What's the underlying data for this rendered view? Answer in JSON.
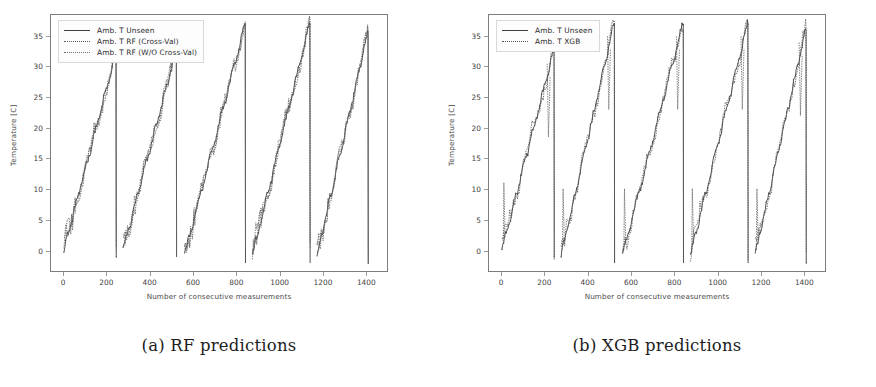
{
  "figure": {
    "background": "#ffffff",
    "panels": [
      {
        "id": "panel-a",
        "caption": "(a) RF predictions",
        "chart_data": {
          "type": "line",
          "title": "",
          "xlabel": "Number of consecutive measurements",
          "ylabel": "Temperature [C]",
          "xlim": [
            -60,
            1500
          ],
          "ylim": [
            -3.5,
            38.5
          ],
          "xticks": [
            0,
            200,
            400,
            600,
            800,
            1000,
            1200,
            1400
          ],
          "yticks": [
            0,
            5,
            10,
            15,
            20,
            25,
            30,
            35
          ],
          "grid": false,
          "legend_position": "upper left",
          "series": [
            {
              "name": "Amb. T Unseen",
              "style": "solid",
              "color": "#3d3d3d",
              "description": "Ground-truth ambient temperature, sawtooth of 5 ramps rising from about 0 C to the cycle peak then dropping vertically back to 0 C",
              "cycles": [
                {
                  "start_x": 0,
                  "end_x": 240,
                  "start_y": 0.0,
                  "peak_y": 32.0
                },
                {
                  "start_x": 275,
                  "end_x": 520,
                  "start_y": 0.0,
                  "peak_y": 32.5
                },
                {
                  "start_x": 560,
                  "end_x": 840,
                  "start_y": -1.0,
                  "peak_y": 37.0
                },
                {
                  "start_x": 875,
                  "end_x": 1140,
                  "start_y": -1.0,
                  "peak_y": 37.0
                },
                {
                  "start_x": 1175,
                  "end_x": 1410,
                  "start_y": -1.0,
                  "peak_y": 35.5
                }
              ]
            },
            {
              "name": "Amb. T RF (Cross-Val)",
              "style": "dotted",
              "color": "#5a5a5a",
              "description": "Random-Forest prediction with cross-validation, closely tracks the ground truth with small lag near ramp starts"
            },
            {
              "name": "Amb. T RF (W/O Cross-Val)",
              "style": "dotted",
              "color": "#6d6d6d",
              "description": "Random-Forest prediction without cross-validation, also closely tracks ground truth"
            }
          ]
        }
      },
      {
        "id": "panel-b",
        "caption": "(b) XGB predictions",
        "chart_data": {
          "type": "line",
          "title": "",
          "xlabel": "Number of consecutive measurements",
          "ylabel": "Temperature [C]",
          "xlim": [
            -60,
            1500
          ],
          "ylim": [
            -3.5,
            38.5
          ],
          "xticks": [
            0,
            200,
            400,
            600,
            800,
            1000,
            1200,
            1400
          ],
          "yticks": [
            0,
            5,
            10,
            15,
            20,
            25,
            30,
            35
          ],
          "grid": false,
          "legend_position": "upper left",
          "series": [
            {
              "name": "Amb. T Unseen",
              "style": "solid",
              "color": "#3d3d3d",
              "description": "Ground-truth ambient temperature, sawtooth of 5 ramps rising from about 0 C to the cycle peak then dropping vertically back to 0 C",
              "cycles": [
                {
                  "start_x": 0,
                  "end_x": 240,
                  "start_y": 0.0,
                  "peak_y": 32.5
                },
                {
                  "start_x": 275,
                  "end_x": 520,
                  "start_y": -1.0,
                  "peak_y": 37.0
                },
                {
                  "start_x": 560,
                  "end_x": 840,
                  "start_y": -1.0,
                  "peak_y": 37.0
                },
                {
                  "start_x": 875,
                  "end_x": 1140,
                  "start_y": -1.0,
                  "peak_y": 37.0
                },
                {
                  "start_x": 1175,
                  "end_x": 1410,
                  "start_y": -1.0,
                  "peak_y": 36.0
                }
              ]
            },
            {
              "name": "Amb. T XGB",
              "style": "dotted",
              "color": "#5a5a5a",
              "description": "XGBoost prediction, follows the sawtooth but shows spiky vertical excursions near the ramp starts and just before each peak"
            }
          ]
        }
      }
    ]
  }
}
